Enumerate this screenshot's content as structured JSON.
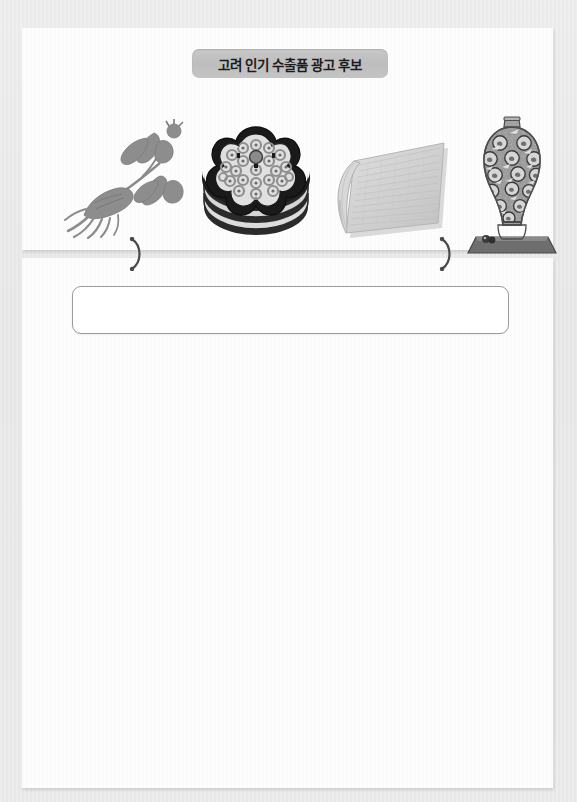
{
  "page": {
    "kind": "scanned-worksheet",
    "background_color": "#e8e8e8",
    "paper_color": "#fdfdfd"
  },
  "top_panel": {
    "title_banner": {
      "label": "고려 인기 수출품 광고 후보",
      "background_color": "#c4c4c4",
      "text_color": "#1b1b1b"
    },
    "illustrations": [
      {
        "id": "ginseng",
        "name": "ginseng-illustration",
        "alt": "인삼",
        "color": "#8e8e8e"
      },
      {
        "id": "lacquerware",
        "name": "mother-of-pearl-lacquerware-illustration",
        "alt": "나전 칠기",
        "color": "#2a2a2a"
      },
      {
        "id": "hanji",
        "name": "hanji-paper-illustration",
        "alt": "종이(한지)",
        "color": "#c9c9c9"
      },
      {
        "id": "celadon",
        "name": "celadon-vase-illustration",
        "alt": "고려 청자",
        "color": "#9a9a9a"
      }
    ],
    "separator_marks": [
      {
        "name": "brace-mark-left",
        "glyph": ")"
      },
      {
        "name": "brace-mark-right",
        "glyph": ")"
      }
    ]
  },
  "bottom_panel": {
    "answer_box": {
      "value": "",
      "placeholder": "",
      "border_color": "#9b9b9b"
    },
    "blank_work_area": {
      "value": ""
    }
  }
}
